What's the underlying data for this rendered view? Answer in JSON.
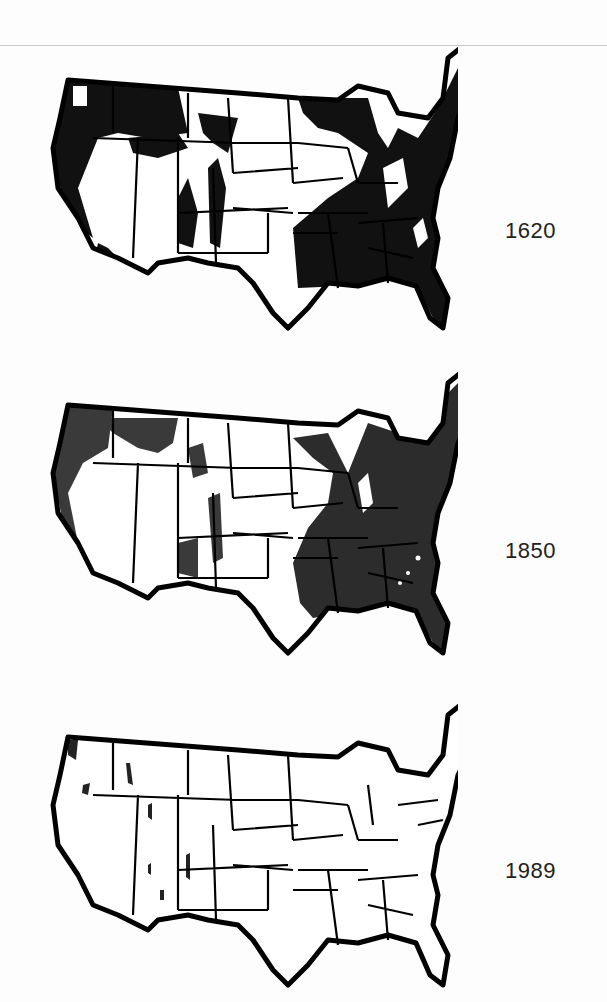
{
  "figure": {
    "panels": [
      {
        "year": "1620",
        "fill": "#111111",
        "coverage": "extensive"
      },
      {
        "year": "1850",
        "fill": "#333333",
        "coverage": "eastern half"
      },
      {
        "year": "1989",
        "fill": "#222222",
        "coverage": "minimal"
      }
    ]
  }
}
